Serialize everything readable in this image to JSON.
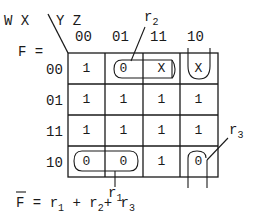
{
  "header": {
    "variables_rows": "W X",
    "variables_cols": "Y Z",
    "function_label": "F ="
  },
  "columns": [
    "00",
    "01",
    "11",
    "10"
  ],
  "rows": [
    {
      "label": "00",
      "cells": [
        "1",
        "0",
        "X",
        "X"
      ]
    },
    {
      "label": "01",
      "cells": [
        "1",
        "1",
        "1",
        "1"
      ]
    },
    {
      "label": "11",
      "cells": [
        "1",
        "1",
        "1",
        "1"
      ]
    },
    {
      "label": "10",
      "cells": [
        "0",
        "0",
        "1",
        "0"
      ]
    }
  ],
  "groupings": {
    "r1": {
      "letter": "r",
      "index": "1"
    },
    "r2": {
      "letter": "r",
      "index": "2"
    },
    "r3": {
      "letter": "r",
      "index": "3"
    }
  },
  "equation": {
    "lhs": "F",
    "eq": "=",
    "terms": [
      {
        "letter": "r",
        "index": "1"
      },
      {
        "letter": "r",
        "index": "2"
      },
      {
        "letter": "r",
        "index": "3"
      }
    ],
    "plus": "+"
  }
}
